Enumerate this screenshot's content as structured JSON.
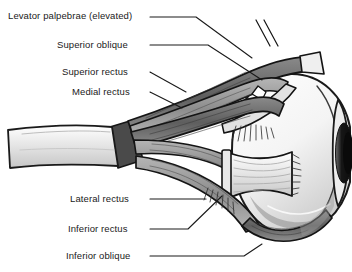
{
  "figure": {
    "background_color": "#ffffff",
    "line_color": "#1a1a1a",
    "text_color": "#1a1a1a",
    "sclera_color": "#f2f2f2",
    "muscle_dark_color": "#6e6e6e",
    "muscle_light_color": "#d8d8d8",
    "pupil_color": "#1a1a1a"
  },
  "labels": [
    {
      "id": "levator-palpebrae",
      "text": "Levator palpebrae (elevated)",
      "x": 8,
      "y": 11
    },
    {
      "id": "superior-oblique",
      "text": "Superior oblique",
      "x": 57,
      "y": 40
    },
    {
      "id": "superior-rectus",
      "text": "Superior rectus",
      "x": 62,
      "y": 67
    },
    {
      "id": "medial-rectus",
      "text": "Medial rectus",
      "x": 72,
      "y": 87
    },
    {
      "id": "lateral-rectus",
      "text": "Lateral rectus",
      "x": 70,
      "y": 194
    },
    {
      "id": "inferior-rectus",
      "text": "Inferior rectus",
      "x": 68,
      "y": 224
    },
    {
      "id": "inferior-oblique",
      "text": "Inferior oblique",
      "x": 66,
      "y": 251
    }
  ],
  "structures": [
    "globe",
    "cornea",
    "iris",
    "pupil",
    "optic-nerve",
    "annulus-of-zinn",
    "levator-palpebrae-muscle",
    "superior-oblique-muscle",
    "superior-oblique-trochlea",
    "superior-rectus-muscle",
    "medial-rectus-muscle",
    "lateral-rectus-muscle",
    "inferior-rectus-muscle",
    "inferior-oblique-muscle"
  ]
}
